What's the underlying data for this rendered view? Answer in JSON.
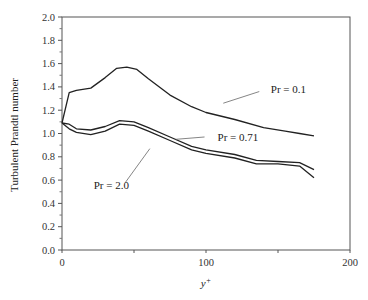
{
  "chart_data": {
    "type": "line",
    "title": "",
    "xlabel": "y+",
    "ylabel": "Turbulent Prandtl number",
    "xlim": [
      0,
      200
    ],
    "ylim": [
      0.0,
      2.0
    ],
    "x_ticks": [
      "0",
      "100",
      "200"
    ],
    "y_ticks": [
      "0.0",
      "0.2",
      "0.4",
      "0.6",
      "0.8",
      "1.0",
      "1.2",
      "1.4",
      "1.6",
      "1.8",
      "2.0"
    ],
    "grid": false,
    "legend": "inline annotations",
    "series": [
      {
        "name": "Pr = 0.1",
        "x": [
          0,
          5,
          10,
          20,
          30,
          38,
          45,
          52,
          60,
          75,
          90,
          100,
          120,
          140,
          155,
          165,
          175
        ],
        "y": [
          1.09,
          1.35,
          1.37,
          1.39,
          1.48,
          1.56,
          1.57,
          1.55,
          1.47,
          1.33,
          1.23,
          1.18,
          1.12,
          1.05,
          1.02,
          1.0,
          0.98
        ]
      },
      {
        "name": "Pr = 0.71",
        "x": [
          0,
          5,
          10,
          20,
          30,
          40,
          50,
          60,
          75,
          90,
          100,
          120,
          135,
          150,
          165,
          175
        ],
        "y": [
          1.09,
          1.08,
          1.04,
          1.03,
          1.06,
          1.11,
          1.1,
          1.05,
          0.97,
          0.89,
          0.86,
          0.82,
          0.77,
          0.76,
          0.75,
          0.69
        ]
      },
      {
        "name": "Pr = 2.0",
        "x": [
          0,
          5,
          10,
          20,
          30,
          40,
          50,
          60,
          75,
          90,
          100,
          120,
          135,
          150,
          165,
          175
        ],
        "y": [
          1.09,
          1.04,
          1.01,
          0.99,
          1.02,
          1.08,
          1.07,
          1.02,
          0.94,
          0.86,
          0.83,
          0.79,
          0.74,
          0.74,
          0.72,
          0.62
        ]
      }
    ],
    "annotations": [
      {
        "text": "Pr = 0.1",
        "x": 145,
        "y": 1.38
      },
      {
        "text": "Pr = 0.71",
        "x": 108,
        "y": 0.97
      },
      {
        "text": "Pr = 2.0",
        "x": 22,
        "y": 0.56
      }
    ]
  }
}
